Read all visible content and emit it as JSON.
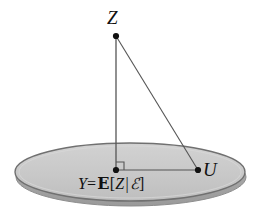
{
  "figure": {
    "kind": "geometry-diagram",
    "background_color": "#ffffff",
    "width": 256,
    "height": 219
  },
  "plane": {
    "name": "subspace-disk",
    "fill_color": "#c9c9c9",
    "stroke_color": "#6e6e6e",
    "shadow_color": "#a3a3a3",
    "center_x": 130,
    "center_y": 172,
    "radius_x": 115,
    "radius_y": 29
  },
  "points": [
    {
      "id": "Z",
      "label": "Z",
      "x": 116,
      "y": 36,
      "label_position": "above",
      "dot_color": "#111111"
    },
    {
      "id": "Y",
      "label": "Y",
      "x": 116,
      "y": 170,
      "label_position": "below",
      "dot_color": "#111111"
    },
    {
      "id": "U",
      "label": "U",
      "x": 198,
      "y": 170,
      "label_position": "right",
      "dot_color": "#111111"
    }
  ],
  "segments": [
    {
      "id": "Z-Y",
      "from": "Z",
      "to": "Y",
      "x1": 116,
      "y1": 36,
      "x2": 116,
      "y2": 170,
      "color": "#555555"
    },
    {
      "id": "Z-U",
      "from": "Z",
      "to": "U",
      "x1": 116,
      "y1": 36,
      "x2": 198,
      "y2": 170,
      "color": "#555555"
    },
    {
      "id": "Y-U",
      "from": "Y",
      "to": "U",
      "x1": 116,
      "y1": 170,
      "x2": 198,
      "y2": 170,
      "color": "#555555"
    }
  ],
  "right_angle_marker": {
    "at_point": "Y",
    "size": 8,
    "opens": "up-right",
    "color": "#555555"
  },
  "labels": {
    "z_label": "Z",
    "u_label": "U",
    "y_variable": "Y",
    "y_equals": "=",
    "expectation_symbol": "ℰ",
    "expectation_operator": "E",
    "bracket_open": "[",
    "random_variable": "Z",
    "conditioning_bar": "|",
    "sigma_algebra": "ℰ",
    "bracket_close": "]",
    "y_full": "Y= E[Z |ℰ]"
  }
}
